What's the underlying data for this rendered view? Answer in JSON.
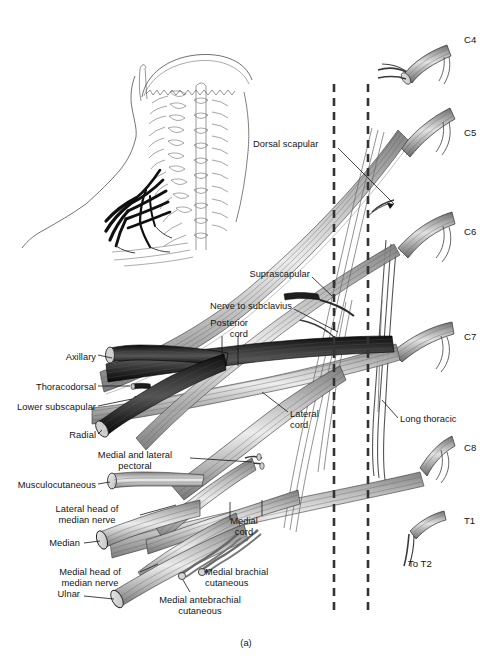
{
  "figure": {
    "caption": "(a)",
    "title_alt": "Brachial plexus schematic with cervical roots C4-T1",
    "colors": {
      "ink": "#141414",
      "posterior_cord": "#1a1a1a",
      "lateral_cord": "#9a9a9a",
      "medial_cord": "#b5b5b5",
      "root_shade": "#8d8d8d",
      "cut_end": "#d8d8d8",
      "dashed_line": "#3a3a3a",
      "background": "#ffffff"
    }
  },
  "inset": {
    "name": "posterior-neck-inset",
    "description": "Posterior view of skull, cervical spine and shoulder with brachial plexus shaded dark"
  },
  "dashed_lines": [
    {
      "name": "dashed-line-left",
      "x": 334
    },
    {
      "name": "dashed-line-right",
      "x": 368
    }
  ],
  "root_labels": [
    {
      "key": "c4",
      "text": "C4",
      "x": 464,
      "y": 40
    },
    {
      "key": "c5",
      "text": "C5",
      "x": 464,
      "y": 133
    },
    {
      "key": "c6",
      "text": "C6",
      "x": 464,
      "y": 230
    },
    {
      "key": "c7",
      "text": "C7",
      "x": 464,
      "y": 336
    },
    {
      "key": "c8",
      "text": "C8",
      "x": 464,
      "y": 447
    },
    {
      "key": "t1",
      "text": "T1",
      "x": 464,
      "y": 519
    },
    {
      "key": "to_t2",
      "text": "To T2",
      "x": 408,
      "y": 563
    }
  ],
  "nerve_labels": [
    {
      "key": "dorsal_scapular",
      "text": "Dorsal scapular",
      "align": "left",
      "x": 253,
      "y": 144
    },
    {
      "key": "supraclavicular_suprascapular",
      "text": "Suprascapular",
      "align": "right",
      "x": 310,
      "y": 274
    },
    {
      "key": "nerve_to_subclavius",
      "text": "Nerve to subclavius",
      "align": "right",
      "x": 292,
      "y": 306
    },
    {
      "key": "posterior_cord",
      "text": "Posterior\ncord",
      "align": "right",
      "x": 248,
      "y": 322
    },
    {
      "key": "axillary",
      "text": "Axillary",
      "align": "right",
      "x": 96,
      "y": 357
    },
    {
      "key": "thoracodorsal",
      "text": "Thoracodorsal",
      "align": "right",
      "x": 96,
      "y": 388
    },
    {
      "key": "lower_subscapular",
      "text": "Lower subscapular",
      "align": "right",
      "x": 96,
      "y": 408
    },
    {
      "key": "radial",
      "text": "Radial",
      "align": "right",
      "x": 96,
      "y": 436
    },
    {
      "key": "lateral_cord",
      "text": "Lateral\ncord",
      "align": "left",
      "x": 290,
      "y": 414
    },
    {
      "key": "long_thoracic",
      "text": "Long thoracic",
      "align": "left",
      "x": 400,
      "y": 419
    },
    {
      "key": "medial_and_lateral_pectoral",
      "text": "Medial and lateral\npectoral",
      "align": "center",
      "x": 135,
      "y": 455
    },
    {
      "key": "musculocutaneous",
      "text": "Musculocutaneous",
      "align": "right",
      "x": 96,
      "y": 485
    },
    {
      "key": "lateral_head_of_median_nerve",
      "text": "Lateral head of\nmedian nerve",
      "align": "center",
      "x": 87,
      "y": 509
    },
    {
      "key": "median",
      "text": "Median",
      "align": "right",
      "x": 80,
      "y": 543
    },
    {
      "key": "medial_cord",
      "text": "Medial\ncord",
      "align": "center",
      "x": 244,
      "y": 521
    },
    {
      "key": "medial_head_of_median_nerve",
      "text": "Medial head of\nmedian nerve",
      "align": "center",
      "x": 90,
      "y": 572
    },
    {
      "key": "ulnar",
      "text": "Ulnar",
      "align": "right",
      "x": 80,
      "y": 594
    },
    {
      "key": "medial_brachial_cutaneous",
      "text": "Medial brachial\ncutaneous",
      "align": "left",
      "x": 205,
      "y": 572
    },
    {
      "key": "medial_antebrachial_cutaneous",
      "text": "Medial antebrachial\ncutaneous",
      "align": "center",
      "x": 200,
      "y": 600
    }
  ]
}
